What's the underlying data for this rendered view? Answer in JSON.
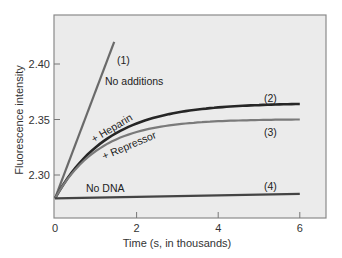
{
  "chart_data": {
    "type": "line",
    "title": "",
    "xlabel": "Time (s, in thousands)",
    "ylabel": "Fluorescence intensity",
    "xlim": [
      0,
      6.6
    ],
    "ylim": [
      2.262,
      2.445
    ],
    "x_ticks": [
      0,
      2,
      4,
      6
    ],
    "x_tick_labels": [
      "0",
      "2",
      "4",
      "6"
    ],
    "y_ticks": [
      2.3,
      2.35,
      2.4
    ],
    "y_tick_labels": [
      "2.30",
      "2.35",
      "2.40"
    ],
    "grid": false,
    "legend": "none (curves labeled inline)",
    "series": [
      {
        "id": "1",
        "name": "(1) No additions",
        "label_number": "(1)",
        "label_text": "No additions",
        "color": "#6a6a6a",
        "shape": "linear",
        "x": [
          0,
          1.45
        ],
        "y": [
          2.279,
          2.42
        ]
      },
      {
        "id": "2",
        "name": "(2) + Heparin",
        "label_number": "(2)",
        "label_text": "+ Heparin",
        "color": "#262626",
        "shape": "saturating",
        "x": [
          0,
          0.5,
          1,
          1.5,
          2,
          3,
          4,
          5,
          6
        ],
        "y": [
          2.279,
          2.306,
          2.325,
          2.338,
          2.347,
          2.356,
          2.361,
          2.363,
          2.364
        ]
      },
      {
        "id": "3",
        "name": "(3) + Repressor",
        "label_number": "(3)",
        "label_text": "+ Repressor",
        "color": "#7a7a7a",
        "shape": "saturating",
        "x": [
          0,
          0.5,
          1,
          1.5,
          2,
          3,
          4,
          5,
          6
        ],
        "y": [
          2.279,
          2.305,
          2.322,
          2.334,
          2.338,
          2.345,
          2.348,
          2.349,
          2.35
        ]
      },
      {
        "id": "4",
        "name": "(4) No DNA",
        "label_number": "(4)",
        "label_text": "No DNA",
        "color": "#444444",
        "shape": "linear",
        "x": [
          0,
          6
        ],
        "y": [
          2.279,
          2.283
        ]
      }
    ]
  },
  "labels": {
    "xlabel": "Time (s, in thousands)",
    "ylabel": "Fluorescence intensity",
    "curve1_num": "(1)",
    "curve1_text": "No additions",
    "curve2_num": "(2)",
    "curve2_text": "+ Heparin",
    "curve3_num": "(3)",
    "curve3_text": "+ Repressor",
    "curve4_num": "(4)",
    "curve4_text": "No DNA"
  },
  "style": {
    "plot_background": "#ebebeb",
    "axis_color": "#777777"
  }
}
